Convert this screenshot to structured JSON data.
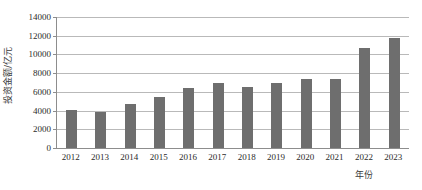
{
  "chart_data": {
    "type": "bar",
    "title": "",
    "xlabel": "年份",
    "ylabel": "投资金额/亿元",
    "categories": [
      "2012",
      "2013",
      "2014",
      "2015",
      "2016",
      "2017",
      "2018",
      "2019",
      "2020",
      "2021",
      "2022",
      "2023"
    ],
    "values": [
      4100,
      3900,
      4700,
      5400,
      6400,
      7000,
      6500,
      6950,
      7400,
      7400,
      10700,
      11800
    ],
    "series": [
      {
        "name": "投资金额",
        "values": [
          4100,
          3900,
          4700,
          5400,
          6400,
          7000,
          6500,
          6950,
          7400,
          7400,
          10700,
          11800
        ]
      }
    ],
    "ylim": [
      0,
      14000
    ],
    "ytick_step": 2000,
    "yticks": [
      0,
      2000,
      4000,
      6000,
      8000,
      10000,
      12000,
      14000
    ],
    "ytick_labels": [
      "0",
      "2000",
      "4000",
      "6000",
      "8000",
      "10000",
      "12000",
      "14000"
    ],
    "grid": "horizontal",
    "legend": "none",
    "bar_color": "#6e6e6e",
    "gridline_color": "#b9b9b9",
    "axis_color": "#8d8d8d",
    "background_color": "#ffffff"
  }
}
